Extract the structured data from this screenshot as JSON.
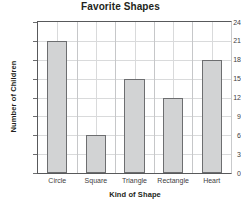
{
  "chart_data": {
    "type": "bar",
    "title": "Favorite Shapes",
    "xlabel": "Kind of Shape",
    "ylabel": "Number of Children",
    "categories": [
      "Circle",
      "Square",
      "Triangle",
      "Rectangle",
      "Heart"
    ],
    "values": [
      21,
      6,
      15,
      12,
      18
    ],
    "yticks": [
      0,
      3,
      6,
      9,
      12,
      15,
      18,
      21,
      24
    ],
    "ylim": [
      0,
      24
    ],
    "grid": true,
    "legend": false,
    "bar_fill": "#d2d3d4",
    "bar_border": "#6d6e70",
    "grid_color": "#d9dadb",
    "axis_color": "#58595b",
    "text_color": "#231f20"
  }
}
